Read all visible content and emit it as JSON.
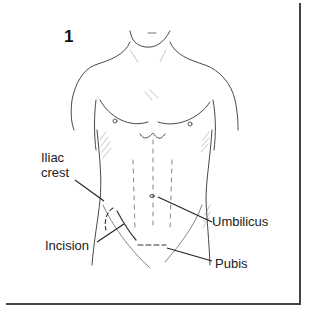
{
  "figure": {
    "number": "1"
  },
  "labels": {
    "iliac_crest_line1": "Iliac",
    "iliac_crest_line2": "crest",
    "incision": "Incision",
    "umbilicus": "Umbilicus",
    "pubis": "Pubis"
  }
}
